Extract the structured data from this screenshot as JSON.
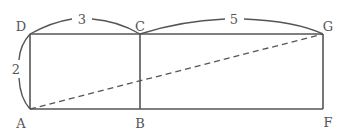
{
  "diagram": {
    "points": {
      "D": {
        "label": "D"
      },
      "C": {
        "label": "C"
      },
      "G": {
        "label": "G"
      },
      "A": {
        "label": "A"
      },
      "B": {
        "label": "B"
      },
      "F": {
        "label": "F"
      }
    },
    "measures": {
      "DC": "3",
      "CG": "5",
      "AD": "2"
    },
    "colors": {
      "line": "#555555",
      "background": "#ffffff"
    }
  }
}
